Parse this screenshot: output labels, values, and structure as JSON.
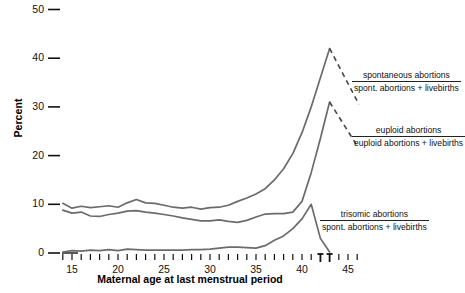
{
  "chart_data": {
    "type": "line",
    "title": "",
    "xlabel": "Maternal age at last menstrual period",
    "ylabel": "Percent",
    "xlim": [
      13.5,
      46.5
    ],
    "ylim": [
      0,
      50
    ],
    "yticks": [
      0,
      10,
      20,
      30,
      40,
      50
    ],
    "xticks_labeled": [
      15,
      20,
      25,
      30,
      35,
      40,
      45
    ],
    "xticks_all": [
      14,
      15,
      16,
      17,
      18,
      19,
      20,
      21,
      22,
      23,
      24,
      25,
      26,
      27,
      28,
      29,
      30,
      31,
      32,
      33,
      34,
      35,
      36,
      37,
      38,
      39,
      40,
      41,
      42,
      43,
      44,
      45,
      46
    ],
    "xticks_tall": [
      42,
      43
    ],
    "grid": false,
    "legend_position": "inline-right-annotations",
    "x": [
      14,
      15,
      16,
      17,
      18,
      19,
      20,
      21,
      22,
      23,
      24,
      25,
      26,
      27,
      28,
      29,
      30,
      31,
      32,
      33,
      34,
      35,
      36,
      37,
      38,
      39,
      40,
      41,
      42,
      43
    ],
    "series": [
      {
        "name": "spontaneous abortions / (spont. abortions + livebirths)",
        "style": "solid",
        "color": "#6b6b6b",
        "values": [
          10.2,
          9.2,
          9.6,
          9.3,
          9.5,
          9.7,
          9.4,
          10.3,
          11.0,
          10.3,
          10.2,
          9.8,
          9.4,
          9.2,
          9.4,
          9.0,
          9.3,
          9.4,
          9.8,
          10.6,
          11.3,
          12.1,
          13.2,
          15.0,
          17.3,
          20.4,
          24.7,
          30.0,
          36.0,
          42.0
        ],
        "dashed_extension": {
          "from_x": 43,
          "from_y": 42.0,
          "to_x": 46.2,
          "to_y": 30.5
        }
      },
      {
        "name": "euploid abortions / (euploid abortions + livebirths)",
        "style": "solid",
        "color": "#6b6b6b",
        "values": [
          8.8,
          8.2,
          8.4,
          7.6,
          7.5,
          7.9,
          8.2,
          8.6,
          8.7,
          8.4,
          8.2,
          7.9,
          7.6,
          7.2,
          6.9,
          6.6,
          6.6,
          6.8,
          6.5,
          6.3,
          6.7,
          7.4,
          8.0,
          8.1,
          8.1,
          8.4,
          10.6,
          16.5,
          23.5,
          31.0
        ],
        "dashed_extension": {
          "from_x": 43,
          "from_y": 31.0,
          "to_x": 46.0,
          "to_y": 22.0
        }
      },
      {
        "name": "trisomic abortions / (spont. abortions + livebirths)",
        "style": "solid",
        "color": "#6b6b6b",
        "values": [
          0.2,
          0.5,
          0.4,
          0.6,
          0.5,
          0.7,
          0.5,
          0.8,
          0.7,
          0.6,
          0.6,
          0.6,
          0.6,
          0.6,
          0.7,
          0.7,
          0.8,
          1.0,
          1.2,
          1.2,
          1.1,
          1.0,
          1.5,
          2.6,
          3.5,
          5.0,
          7.0,
          10.0,
          3.0,
          0.2
        ]
      }
    ],
    "annotations": [
      {
        "id": "spontaneous",
        "numerator": "spontaneous abortions",
        "denominator": "spont. abortions + livebirths",
        "x": 352,
        "y": 70
      },
      {
        "id": "euploid",
        "numerator": "euploid abortions",
        "denominator": "euploid abortions + livebirths",
        "x": 352,
        "y": 125
      },
      {
        "id": "trisomic",
        "numerator": "trisomic abortions",
        "denominator": "spont. abortions + livebirths",
        "x": 320,
        "y": 209
      }
    ]
  },
  "axis": {
    "ylabel_text": "Percent",
    "xlabel_text": "Maternal age at last menstrual period",
    "ytick_labels": [
      "50",
      "40",
      "30",
      "20",
      "10",
      "0"
    ],
    "xtick_labels": [
      "15",
      "20",
      "25",
      "30",
      "35",
      "40",
      "45"
    ]
  }
}
